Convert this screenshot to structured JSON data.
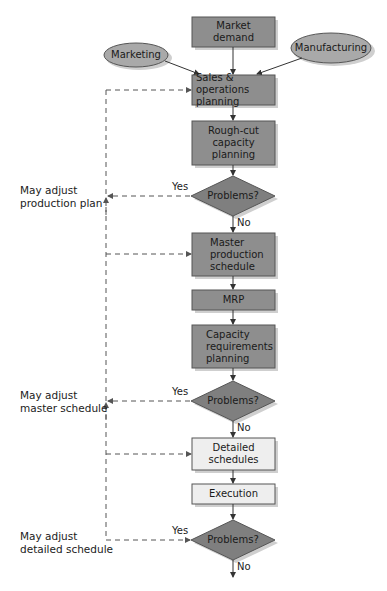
{
  "diagram": {
    "colors": {
      "dark_box": "#8e8e8e",
      "light_box": "#eeeeee",
      "diamond": "#808080",
      "ellipse": "#a9a9a9",
      "shadow": "#c8c8c8",
      "line": "#333333",
      "dashed": "#555555"
    },
    "inputs": {
      "market_demand": "Market\ndemand",
      "marketing": "Marketing",
      "manufacturing": "Manufacturing"
    },
    "nodes": [
      {
        "id": "sop",
        "label": "Sales & operations\nplanning",
        "style": "dark"
      },
      {
        "id": "rough_cut",
        "label": "Rough-cut\ncapacity\nplanning",
        "style": "dark"
      },
      {
        "id": "decision1",
        "label": "Problems?",
        "style": "diamond"
      },
      {
        "id": "mps",
        "label": "Master\nproduction\nschedule",
        "style": "dark"
      },
      {
        "id": "mrp",
        "label": "MRP",
        "style": "dark"
      },
      {
        "id": "crp",
        "label": "Capacity\nrequirements\nplanning",
        "style": "dark"
      },
      {
        "id": "decision2",
        "label": "Problems?",
        "style": "diamond"
      },
      {
        "id": "detailed",
        "label": "Detailed\nschedules",
        "style": "light"
      },
      {
        "id": "execution",
        "label": "Execution",
        "style": "light"
      },
      {
        "id": "decision3",
        "label": "Problems?",
        "style": "diamond"
      }
    ],
    "branch_labels": {
      "yes": "Yes",
      "no": "No"
    },
    "feedback_notes": [
      "May adjust\nproduction plan",
      "May adjust\nmaster schedule",
      "May adjust\ndetailed schedule"
    ]
  }
}
